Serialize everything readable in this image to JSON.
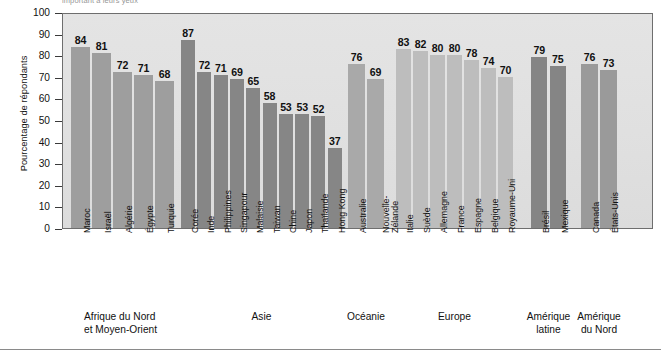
{
  "chart": {
    "title_partial": "important à leurs yeux",
    "ylabel": "Pourcentage de répondants",
    "xlabel": ""
  },
  "axis": {
    "yticks": [
      "100",
      "90",
      "80",
      "70",
      "60",
      "50",
      "40",
      "30",
      "20",
      "10",
      "0"
    ]
  },
  "colors": {
    "bar_dark": "#8a8a8a",
    "bar_mid": "#9b9b9b",
    "bar_light": "#b4b4b4",
    "bar_lighter": "#c2c2c2",
    "plot_background": "#e2e2e2",
    "plot_border": "#6e6e6e",
    "text": "#111111"
  },
  "groups": [
    {
      "label": "Afrique du Nord\net Moyen-Orient",
      "label_lines": [
        "Afrique du Nord",
        "et Moyen-Orient"
      ],
      "shade": "#9e9e9e",
      "countries": [
        "Maroc",
        "Israël",
        "Algérie",
        "Égypte",
        "Turquie"
      ],
      "values": [
        84,
        81,
        72,
        71,
        68
      ]
    },
    {
      "label": "Asie",
      "label_lines": [
        "Asie"
      ],
      "shade": "#868686",
      "countries": [
        "Corée",
        "Inde",
        "Philippines",
        "Singapour",
        "Malaisie",
        "Taiwan",
        "Chine",
        "Japon",
        "Thaïlande",
        "Hong Kong"
      ],
      "values": [
        87,
        72,
        71,
        69,
        65,
        58,
        53,
        53,
        52,
        37
      ]
    },
    {
      "label": "Océanie",
      "label_lines": [
        "Océanie"
      ],
      "shade": "#a9a9a9",
      "countries": [
        "Australie",
        "Nouvelle-Zélande"
      ],
      "values": [
        76,
        69
      ]
    },
    {
      "label": "Europe",
      "label_lines": [
        "Europe"
      ],
      "shade": "#bdbdbd",
      "countries": [
        "Italie",
        "Suède",
        "Allemagne",
        "France",
        "Espagne",
        "Belgique",
        "Royaume-Uni"
      ],
      "values": [
        83,
        82,
        80,
        80,
        78,
        74,
        70
      ]
    },
    {
      "label": "Amérique\nlatine",
      "label_lines": [
        "Amérique",
        "latine"
      ],
      "shade": "#858585",
      "countries": [
        "Brésil",
        "Mexique"
      ],
      "values": [
        79,
        75
      ]
    },
    {
      "label": "Amérique\ndu Nord",
      "label_lines": [
        "Amérique",
        "du Nord"
      ],
      "shade": "#9a9a9a",
      "countries": [
        "Canada",
        "États-Unis"
      ],
      "values": [
        76,
        73
      ]
    }
  ],
  "chart_data": {
    "type": "bar",
    "title": "important à leurs yeux",
    "xlabel": "",
    "ylabel": "Pourcentage de répondants",
    "ylim": [
      0,
      100
    ],
    "ytick_step": 10,
    "grid": false,
    "legend": "none",
    "categories": [
      "Maroc",
      "Israël",
      "Algérie",
      "Égypte",
      "Turquie",
      "Corée",
      "Inde",
      "Philippines",
      "Singapour",
      "Malaisie",
      "Taiwan",
      "Chine",
      "Japon",
      "Thaïlande",
      "Hong Kong",
      "Australie",
      "Nouvelle-Zélande",
      "Italie",
      "Suède",
      "Allemagne",
      "France",
      "Espagne",
      "Belgique",
      "Royaume-Uni",
      "Brésil",
      "Mexique",
      "Canada",
      "États-Unis"
    ],
    "values": [
      84,
      81,
      72,
      71,
      68,
      87,
      72,
      71,
      69,
      65,
      58,
      53,
      53,
      52,
      37,
      76,
      69,
      83,
      82,
      80,
      80,
      78,
      74,
      70,
      79,
      75,
      76,
      73
    ],
    "group_labels": [
      "Afrique du Nord et Moyen-Orient",
      "Asie",
      "Océanie",
      "Europe",
      "Amérique latine",
      "Amérique du Nord"
    ],
    "group_sizes": [
      5,
      10,
      2,
      7,
      2,
      2
    ]
  }
}
